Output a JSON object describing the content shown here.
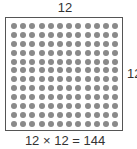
{
  "diagram": {
    "top_label": "12",
    "side_label": "12",
    "rows": 12,
    "columns": 12,
    "dot_color": "#8a8a8a",
    "border_color": "#555555",
    "equation": "12 × 12 = 144"
  }
}
